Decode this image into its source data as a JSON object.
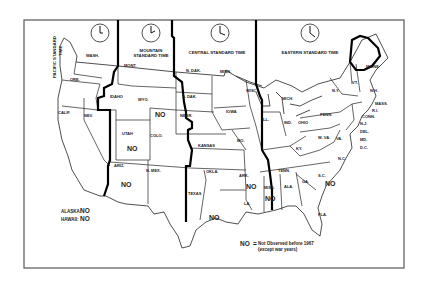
{
  "map": {
    "title": "U.S. Standard Time Zones – Daylight Saving Time observance",
    "time_zones": [
      {
        "id": "pacific",
        "label_line1": "PACIFIC STANDARD",
        "label_line2": "TIME",
        "clock_time": "12:00"
      },
      {
        "id": "mountain",
        "label_line1": "MOUNTAIN",
        "label_line2": "STANDARD TIME",
        "clock_time": "1:00"
      },
      {
        "id": "central",
        "label_line1": "CENTRAL STANDARD TIME",
        "clock_time": "2:00"
      },
      {
        "id": "eastern",
        "label_line1": "EASTERN STANDARD TIME",
        "clock_time": "3:00"
      }
    ],
    "states": {
      "wash": "WASH.",
      "ore": "ORE.",
      "calif": "CALIF.",
      "nev": "NEV.",
      "idaho": "IDAHO",
      "mont": "MONT.",
      "wyo": "WYO.",
      "utah": "UTAH",
      "colo": "COLO.",
      "ariz": "ARIZ.",
      "nmex": "N. MEX.",
      "ndak": "N. DAK.",
      "sdak": "S. DAK.",
      "nebr": "NEBR.",
      "kansas": "KANSAS",
      "okla": "OKLA.",
      "texas": "TEXAS",
      "minn": "MINN.",
      "iowa": "IOWA",
      "mo": "MO.",
      "ark": "ARK.",
      "la": "LA.",
      "wisc": "WISC.",
      "ill": "ILL.",
      "miss": "MISS.",
      "mich": "MICH.",
      "ind": "IND.",
      "ohio": "OHIO",
      "ky": "KY.",
      "tenn": "TENN.",
      "ala": "ALA.",
      "ga": "GA.",
      "fla": "FLA.",
      "sc": "S.C.",
      "nc": "N.C.",
      "va": "VA.",
      "wva": "W. VA.",
      "penn": "PENN.",
      "ny": "N.Y.",
      "vt": "VT.",
      "nh": "N.H.",
      "maine": "MAINE",
      "mass": "MASS.",
      "ri": "R.I.",
      "conn": "CONN.",
      "nj": "N.J.",
      "del": "DEL.",
      "md": "MD.",
      "dc": "D.C."
    },
    "no_marker": "NO",
    "no_states": [
      "WYO.",
      "UTAH",
      "ARIZ.",
      "TEXAS",
      "ARK.",
      "MISS.",
      "S.C.",
      "ALASKA",
      "HAWAII"
    ],
    "alaska_label": "ALASKA:",
    "hawaii_label": "HAWAII:",
    "legend": {
      "key": "NO",
      "equals": "=",
      "line1": "Not Observed before 1967",
      "line2": "(except war years)"
    }
  }
}
